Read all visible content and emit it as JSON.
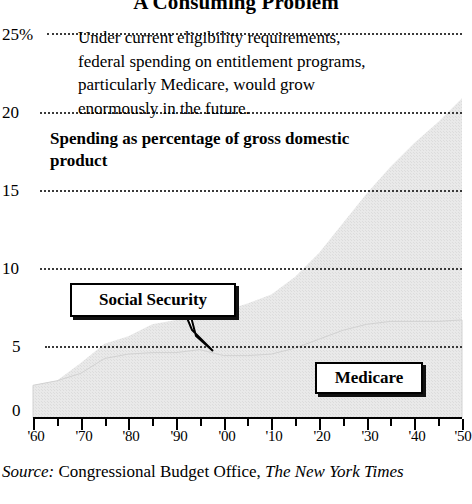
{
  "chart_data": {
    "type": "area",
    "title": "A Consuming Problem",
    "subtitle": "Spending as percentage of gross domestic product",
    "annotation": "Under current eligibility requirements, federal spending on entitlement programs, particularly Medicare, would grow enormously in the future.",
    "xlabel": "",
    "ylabel": "",
    "ylim": [
      0,
      26.5
    ],
    "xlim": [
      1960,
      2050
    ],
    "grid": true,
    "gridstyle": "dotted",
    "legend_position": "inline-callouts",
    "ytick_labels": [
      "0",
      "5",
      "10",
      "15",
      "20",
      "25%"
    ],
    "ytick_values": [
      0,
      5,
      10,
      15,
      20,
      25
    ],
    "xtick_labels": [
      "'60",
      "'70",
      "'80",
      "'90",
      "'00",
      "'10",
      "'20",
      "'30",
      "'40",
      "'50"
    ],
    "xtick_values": [
      1960,
      1970,
      1980,
      1990,
      2000,
      2010,
      2020,
      2030,
      2040,
      2050
    ],
    "xminor_values": [
      1965,
      1975,
      1985,
      1995,
      2005,
      2015,
      2025,
      2035,
      2045
    ],
    "stacked": true,
    "x": [
      1960,
      1965,
      1970,
      1975,
      1980,
      1985,
      1990,
      1995,
      2000,
      2005,
      2010,
      2015,
      2020,
      2025,
      2030,
      2035,
      2040,
      2045,
      2050
    ],
    "series": [
      {
        "name": "Social Security",
        "color": "#e4e4e4",
        "values": [
          2.2,
          2.5,
          3.0,
          4.0,
          4.3,
          4.4,
          4.4,
          4.6,
          4.2,
          4.2,
          4.3,
          4.7,
          5.3,
          5.9,
          6.3,
          6.5,
          6.5,
          6.5,
          6.6
        ]
      },
      {
        "name": "Medicare",
        "color": "#e4e4e4",
        "values": [
          0.0,
          0.0,
          0.7,
          1.0,
          1.2,
          1.9,
          2.2,
          2.8,
          3.0,
          3.5,
          4.0,
          4.8,
          5.8,
          7.2,
          8.8,
          10.4,
          12.0,
          13.4,
          14.9
        ]
      }
    ],
    "total_values": [
      2.2,
      2.5,
      3.7,
      5.0,
      5.5,
      6.3,
      6.6,
      7.4,
      7.2,
      7.7,
      8.3,
      9.5,
      11.1,
      13.1,
      15.1,
      16.9,
      18.5,
      19.9,
      21.5
    ],
    "callouts": [
      {
        "label": "Social Security",
        "points_to_series": "Social Security"
      },
      {
        "label": "Medicare",
        "points_to_series": "Medicare"
      }
    ]
  },
  "source": {
    "prefix": "Source:",
    "org": "Congressional Budget Office,",
    "publication": "The New York Times"
  }
}
